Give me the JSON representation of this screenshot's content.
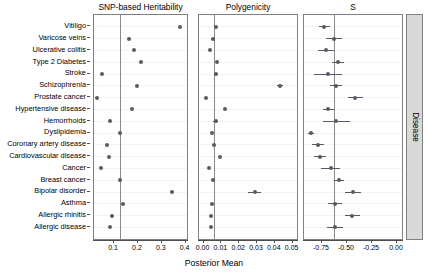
{
  "figure": {
    "xaxis_title": "Posterior Mean",
    "strip_label": "Disease"
  },
  "chart_data": {
    "type": "scatter",
    "title": "",
    "subtitle": "",
    "xlabel": "Posterior Mean",
    "ylabel": "",
    "legend": "none",
    "grid": true,
    "orientation": "horizontal-forest-plot",
    "strip_label": "Disease",
    "categories": [
      "Vitiligo",
      "Varicose veins",
      "Ulcerative colitis",
      "Type 2 Diabetes",
      "Stroke",
      "Schizophrenia",
      "Prostate cancer",
      "Hypertensive disease",
      "Hemorrhoids",
      "Dyslipidemia",
      "Coronary artery disease",
      "Cardiovascular disease",
      "Cancer",
      "Breast cancer",
      "Bipolar disorder",
      "Asthma",
      "Allergic rhinitis",
      "Allergic disease"
    ],
    "panels": [
      {
        "title": "SNP-based Heritability",
        "xlim": [
          0.02,
          0.41
        ],
        "ticks": [
          0.1,
          0.2,
          0.3,
          0.4
        ],
        "ticklabels": [
          "0.1",
          "0.2",
          "0.3",
          "0.4"
        ],
        "reference_line": 0.129,
        "values": [
          0.381,
          0.168,
          0.188,
          0.215,
          0.054,
          0.2,
          0.031,
          0.18,
          0.088,
          0.129,
          0.074,
          0.082,
          0.048,
          0.129,
          0.345,
          0.143,
          0.095,
          0.087
        ],
        "lower": [
          0.381,
          0.168,
          0.188,
          0.215,
          0.054,
          0.2,
          0.031,
          0.18,
          0.088,
          0.129,
          0.074,
          0.082,
          0.048,
          0.129,
          0.345,
          0.143,
          0.095,
          0.087
        ],
        "upper": [
          0.381,
          0.168,
          0.188,
          0.215,
          0.054,
          0.2,
          0.031,
          0.18,
          0.088,
          0.129,
          0.074,
          0.082,
          0.048,
          0.129,
          0.345,
          0.143,
          0.095,
          0.087
        ]
      },
      {
        "title": "Polygenicity",
        "xlim": [
          -0.002,
          0.053
        ],
        "ticks": [
          0.0,
          0.01,
          0.02,
          0.03,
          0.04,
          0.05
        ],
        "ticklabels": [
          "0.00",
          "0.01",
          "0.02",
          "0.03",
          "0.04",
          "0.05"
        ],
        "reference_line": 0.0065,
        "values": [
          0.0077,
          0.0057,
          0.004,
          0.0082,
          0.0075,
          0.0435,
          0.0022,
          0.0128,
          0.0073,
          0.0055,
          0.0062,
          0.0098,
          0.0038,
          0.006,
          0.0295,
          0.0052,
          0.0047,
          0.005
        ],
        "lower": [
          0.0077,
          0.0057,
          0.004,
          0.0082,
          0.0062,
          0.042,
          0.0022,
          0.0128,
          0.006,
          0.0055,
          0.0062,
          0.0098,
          0.0038,
          0.006,
          0.0255,
          0.0052,
          0.0047,
          0.005
        ],
        "upper": [
          0.0077,
          0.0057,
          0.004,
          0.0082,
          0.0088,
          0.0452,
          0.0022,
          0.0128,
          0.0086,
          0.0055,
          0.0062,
          0.0098,
          0.0038,
          0.006,
          0.033,
          0.0052,
          0.0047,
          0.005
        ]
      },
      {
        "title": "S",
        "xlim": [
          -0.92,
          0.06
        ],
        "ticks": [
          -0.75,
          -0.5,
          -0.25,
          0.0
        ],
        "ticklabels": [
          "-0.75",
          "-0.50",
          "-0.25",
          "0.00"
        ],
        "reference_line": -0.62,
        "values": [
          -0.72,
          -0.62,
          -0.7,
          -0.58,
          -0.68,
          -0.6,
          -0.41,
          -0.68,
          -0.6,
          -0.85,
          -0.78,
          -0.76,
          -0.65,
          -0.57,
          -0.43,
          -0.61,
          -0.44,
          -0.61
        ],
        "lower": [
          -0.77,
          -0.7,
          -0.78,
          -0.64,
          -0.82,
          -0.66,
          -0.48,
          -0.73,
          -0.73,
          -0.88,
          -0.84,
          -0.82,
          -0.75,
          -0.62,
          -0.51,
          -0.68,
          -0.51,
          -0.69
        ],
        "upper": [
          -0.66,
          -0.54,
          -0.62,
          -0.52,
          -0.54,
          -0.54,
          -0.33,
          -0.62,
          -0.46,
          -0.82,
          -0.72,
          -0.7,
          -0.56,
          -0.52,
          -0.35,
          -0.54,
          -0.36,
          -0.53
        ]
      }
    ]
  }
}
